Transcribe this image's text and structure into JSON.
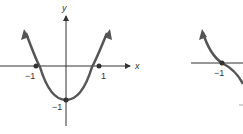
{
  "figures": [
    {
      "name": "parabola-graph",
      "function": "y = x^2 - 1",
      "axis_labels": {
        "x": "x",
        "y": "y"
      },
      "tick_labels": {
        "x_neg": "−1",
        "x_pos": "1",
        "y_neg": "−1"
      },
      "key_points": [
        {
          "x": -1,
          "y": 0
        },
        {
          "x": 1,
          "y": 0
        },
        {
          "x": 0,
          "y": -1
        }
      ]
    },
    {
      "name": "cubic-like-graph-partial",
      "tick_labels": {
        "x_neg": "−1"
      },
      "key_points": [
        {
          "x": -1,
          "y": 0
        }
      ]
    }
  ],
  "colors": {
    "curve": "#555555",
    "axis": "#333333",
    "background": "#ffffff"
  }
}
